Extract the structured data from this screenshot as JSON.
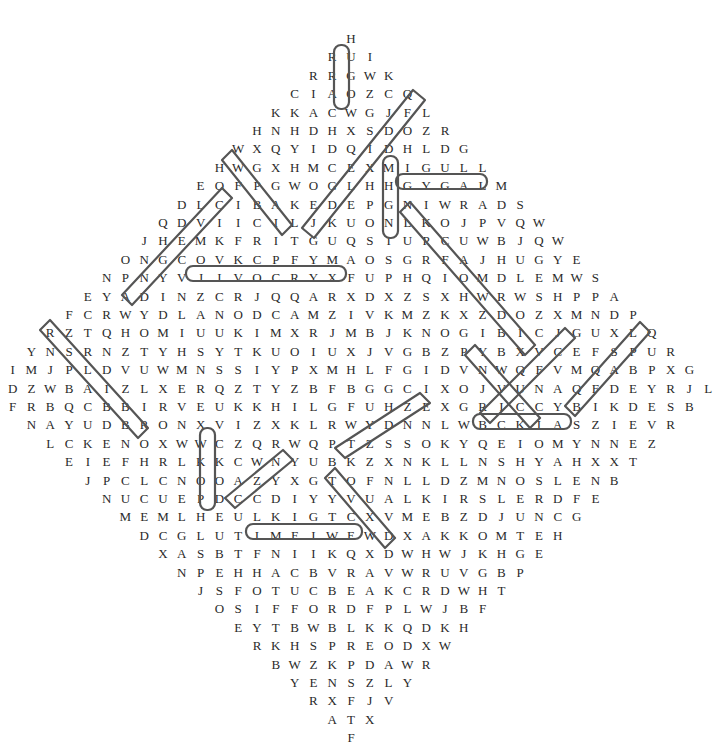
{
  "puzzle": {
    "type": "word-search",
    "shape": "diamond",
    "rows": [
      "H",
      "RUI",
      "RRGWK",
      "CIAOZCQ",
      "KKACWGJFL",
      "HNHDHXSDOZR",
      "WXQYIDQIDHLDG",
      "HWGXHMCEXMIGULL",
      "EOFPGWOGLHHGYGALM",
      "DLCIBAKEDEPGNIWRADS",
      "QDVIICILJKUONLKOJPVQW",
      "JHEMKFRITGUQSIUPCUWBJQW",
      "ONGCOVKCPFYMAOSGRFAJHUGYE",
      "NPNYVJIVOCRYXFUPHQIOMDLEMWS",
      "EYADINZCRJQQARXDXZSXHWRWSHPPA",
      "FCRWYDLANODCAMZIVKMZKXZDOZXMNDP",
      "RZTQHOMIUUKIMXRJMBJKNOGIBICJGUXLQ",
      "YNSRNZTYHSYTKUOIUXJVGBZPYBXVCEFSPUR",
      "IMJPLDVUWMNSSIYPXMHLFGIDVNWQFVMQABPXG",
      "ODZWBAIZLXERQZTYZBFBGGCIXOJVUNAQFDEYRJL",
      "FRBQCBBIRVEUKKHILGFUHZEXGRICCYBIKDESB",
      "NAYUDBRONXVIZXKLRWYDNNLWBCKIASZIEVR",
      "LCKENOXWWCZQRWQPTZSSOKYQEIOMYNNEZ",
      "EIEFHRLKKCWNYUBKZXNKLLNSHYAHXXT",
      "JPCLCNOOAZYXGTOFNLLDZMNOSLENB",
      "NUCUEPDCCDIYYVUALKIRSLERDFE",
      "MEMLHEULKIGTCXVMEBZDJUNCG",
      "DCGLUTIMFIWEWDXAKKOMTEH",
      "XASBTFNIIKQXDWHWJKHGE",
      "NPEHHACBVRAVWRUVGBP",
      "JSFOTUCBEAKCRDWHT",
      "OSIFFORDFPLWJBF",
      "EYTBWBLKKQDKH",
      "RKHSPREODXW",
      "BWZKPDAWR",
      "YENSZLY",
      "RXFJV",
      "ATX",
      "F"
    ],
    "found_words": [
      "CARR",
      "DARWIN",
      "MACDONALD",
      "NELSON",
      "DROFFIS",
      "HGNIS",
      "NAGLE"
    ],
    "marks": [
      {
        "word": "CARR",
        "from": [
          4,
          4
        ],
        "to": [
          1,
          1
        ],
        "dir": "vertical"
      },
      {
        "word": "DARWIN",
        "from": [
          9,
          17
        ],
        "to": [
          9,
          12
        ],
        "dir": "horizontal"
      },
      {
        "word": "MACDONALD",
        "from": [
          15,
          13
        ],
        "to": [
          15,
          5
        ],
        "dir": "horizontal"
      },
      {
        "word": "NELSON",
        "from": [
          23,
          27
        ],
        "to": [
          23,
          22
        ],
        "dir": "horizontal"
      },
      {
        "word": "SIFFORD",
        "from": [
          30,
          1
        ],
        "to": [
          30,
          7
        ],
        "dir": "horizontal"
      },
      {
        "word": "HINGS",
        "from": [
          8,
          10
        ],
        "to": [
          12,
          10
        ],
        "dir": "vertical"
      },
      {
        "word": "ELGAN",
        "from": [
          24,
          4
        ],
        "to": [
          28,
          0
        ],
        "dir": "vertical"
      }
    ]
  }
}
